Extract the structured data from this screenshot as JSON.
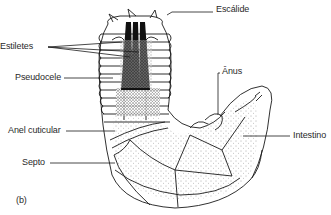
{
  "figure": {
    "panel_label": "(b)",
    "labels": {
      "escalide": "Escálide",
      "estiletes": "Estiletes",
      "pseudocele": "Pseudocele",
      "anus": "Ânus",
      "anel_cuticular": "Anel cuticular",
      "intestino": "Intestino",
      "septo": "Septo"
    },
    "colors": {
      "ink": "#1a1a1a",
      "paper": "#ffffff",
      "stippling": "#555555"
    }
  }
}
